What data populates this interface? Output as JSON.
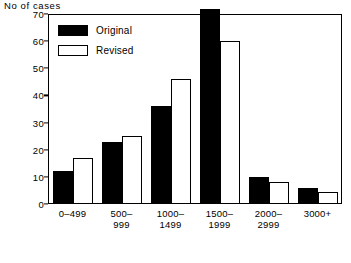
{
  "chart_data": {
    "type": "bar",
    "title": "",
    "xlabel": "",
    "ylabel": "No of cases",
    "ylim": [
      0,
      70
    ],
    "yticks": [
      0,
      10,
      20,
      30,
      40,
      50,
      60,
      70
    ],
    "grid": false,
    "legend_position": "top-left",
    "categories": [
      "0–499",
      "500–\n999",
      "1000–\n1499",
      "1500–\n1999",
      "2000–\n2999",
      "3000+"
    ],
    "category_lines": [
      [
        "0–499"
      ],
      [
        "500–",
        "999"
      ],
      [
        "1000–",
        "1499"
      ],
      [
        "1500–",
        "1999"
      ],
      [
        "2000–",
        "2999"
      ],
      [
        "3000+"
      ]
    ],
    "series": [
      {
        "name": "Original",
        "color": "#000000",
        "style": "filled",
        "values": [
          12,
          23,
          36,
          72,
          10,
          6
        ]
      },
      {
        "name": "Revised",
        "color": "#ffffff",
        "style": "outline",
        "values": [
          17,
          25,
          46,
          60,
          8,
          4.5
        ]
      }
    ]
  },
  "axis": {
    "y_title": "No of cases",
    "tick_labels": [
      "70",
      "60",
      "50",
      "40",
      "30",
      "20",
      "10",
      "0"
    ],
    "tick_values": [
      70,
      60,
      50,
      40,
      30,
      20,
      10,
      0
    ]
  },
  "legend": {
    "items": [
      {
        "label": "Original",
        "swatch": "filled-black"
      },
      {
        "label": "Revised",
        "swatch": "outline-white"
      }
    ]
  },
  "x_labels": [
    {
      "line1": "0–499",
      "line2": ""
    },
    {
      "line1": "500–",
      "line2": "999"
    },
    {
      "line1": "1000–",
      "line2": "1499"
    },
    {
      "line1": "1500–",
      "line2": "1999"
    },
    {
      "line1": "2000–",
      "line2": "2999"
    },
    {
      "line1": "3000+",
      "line2": ""
    }
  ],
  "colors": {
    "original": "#000000",
    "revised": "#ffffff",
    "axis": "#000000",
    "background": "#ffffff"
  }
}
